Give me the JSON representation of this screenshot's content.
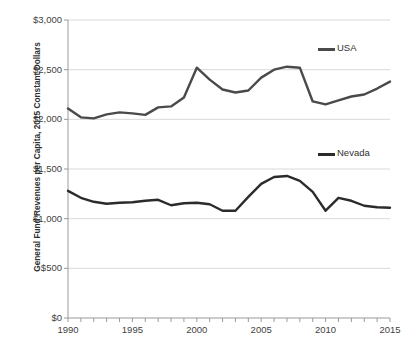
{
  "chart_data": {
    "type": "line",
    "title": "",
    "xlabel": "",
    "ylabel": "General Fund Revenues per Capita, 2015 Constant Dollars",
    "x": [
      1990,
      1991,
      1992,
      1993,
      1994,
      1995,
      1996,
      1997,
      1998,
      1999,
      2000,
      2001,
      2002,
      2003,
      2004,
      2005,
      2006,
      2007,
      2008,
      2009,
      2010,
      2011,
      2012,
      2013,
      2014,
      2015
    ],
    "xlim": [
      1990,
      2015
    ],
    "ylim": [
      0,
      3000
    ],
    "grid": "horizontal",
    "legend_position": "inside-right",
    "series": [
      {
        "name": "USA",
        "color": "#4a4a4a",
        "values": [
          2110,
          2020,
          2010,
          2050,
          2070,
          2060,
          2045,
          2120,
          2130,
          2220,
          2520,
          2400,
          2300,
          2270,
          2290,
          2420,
          2500,
          2530,
          2520,
          2180,
          2150,
          2190,
          2230,
          2250,
          2310,
          2380
        ]
      },
      {
        "name": "Nevada",
        "color": "#2b2b2b",
        "values": [
          1280,
          1210,
          1170,
          1150,
          1160,
          1165,
          1180,
          1190,
          1135,
          1155,
          1160,
          1145,
          1080,
          1080,
          1220,
          1350,
          1420,
          1430,
          1380,
          1270,
          1080,
          1210,
          1180,
          1130,
          1115,
          1110
        ]
      }
    ],
    "y_ticks": [
      {
        "value": 0,
        "label": "$0"
      },
      {
        "value": 500,
        "label": "$500"
      },
      {
        "value": 1000,
        "label": "$1,000"
      },
      {
        "value": 1500,
        "label": "$1,500"
      },
      {
        "value": 2000,
        "label": "$2,000"
      },
      {
        "value": 2500,
        "label": "$2,500"
      },
      {
        "value": 3000,
        "label": "$3,000"
      }
    ],
    "x_ticks_labeled": [
      {
        "value": 1990,
        "label": "1990"
      },
      {
        "value": 1995,
        "label": "1995"
      },
      {
        "value": 2000,
        "label": "2000"
      },
      {
        "value": 2005,
        "label": "2005"
      },
      {
        "value": 2010,
        "label": "2010"
      },
      {
        "value": 2015,
        "label": "2015"
      }
    ],
    "legend": [
      {
        "label": "USA",
        "color": "#4a4a4a"
      },
      {
        "label": "Nevada",
        "color": "#2b2b2b"
      }
    ]
  },
  "colors": {
    "background": "#ffffff",
    "gridline": "#d9d9d9",
    "axis": "#9a9a9a",
    "text": "#3f3f3f",
    "usa_line": "#4a4a4a",
    "nevada_line": "#2b2b2b"
  }
}
